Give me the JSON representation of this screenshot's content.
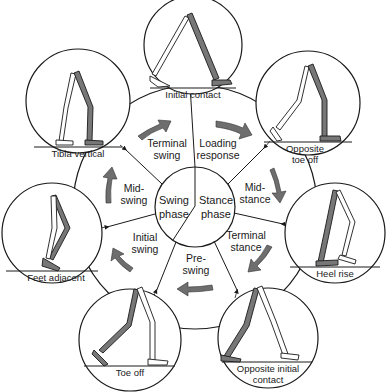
{
  "diagram": {
    "type": "gait cycle",
    "center": {
      "left_phase": [
        "Swing",
        "phase"
      ],
      "right_phase": [
        "Stance",
        "phase"
      ]
    },
    "segments": [
      {
        "id": "loading-response",
        "lines": [
          "Loading",
          "response"
        ]
      },
      {
        "id": "mid-stance",
        "lines": [
          "Mid-",
          "stance"
        ]
      },
      {
        "id": "terminal-stance",
        "lines": [
          "Terminal",
          "stance"
        ]
      },
      {
        "id": "pre-swing",
        "lines": [
          "Pre-",
          "swing"
        ]
      },
      {
        "id": "initial-swing",
        "lines": [
          "Initial",
          "swing"
        ]
      },
      {
        "id": "mid-swing",
        "lines": [
          "Mid-",
          "swing"
        ]
      },
      {
        "id": "terminal-swing",
        "lines": [
          "Terminal",
          "swing"
        ]
      }
    ],
    "events": [
      {
        "id": "initial-contact",
        "lines": [
          "Initial contact"
        ]
      },
      {
        "id": "opposite-toe-off",
        "lines": [
          "Opposite",
          "toe off"
        ]
      },
      {
        "id": "heel-rise",
        "lines": [
          "Heel rise"
        ]
      },
      {
        "id": "opposite-initial-contact",
        "lines": [
          "Opposite initial",
          "contact"
        ]
      },
      {
        "id": "toe-off",
        "lines": [
          "Toe off"
        ]
      },
      {
        "id": "feet-adjacent",
        "lines": [
          "Feet adjacent"
        ]
      },
      {
        "id": "tibia-vertical",
        "lines": [
          "Tibia vertical"
        ]
      }
    ],
    "colors": {
      "line": "#1a1a1a",
      "limb_shaded": "#777777",
      "arrow": "#6e6e6e"
    }
  }
}
